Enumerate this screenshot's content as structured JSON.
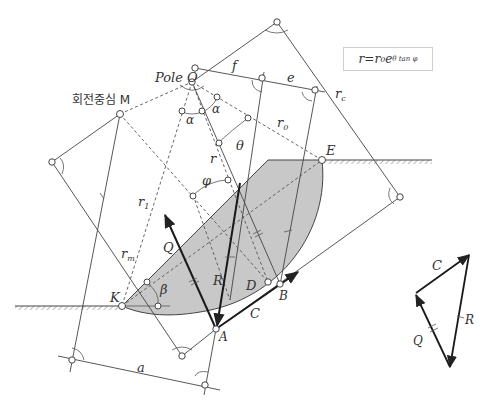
{
  "figure": {
    "formula": {
      "lhs": "r",
      "eq": " = ",
      "r0": "r",
      "r0_sub": "0",
      "base": "e",
      "exp": "θ tan φ"
    },
    "labels": {
      "pole": "Pole O",
      "rotation_center": "회전중심 M",
      "f": "f",
      "e": "e",
      "rc": "r",
      "rc_sub": "c",
      "r0": "r",
      "r0_sub": "0",
      "alpha1": "α",
      "alpha2": "α",
      "theta": "θ",
      "r": "r",
      "phi": "φ",
      "r1": "r",
      "r1_sub": "1",
      "rm": "r",
      "rm_sub": "m",
      "E": "E",
      "K": "K",
      "beta": "β",
      "Q": "Q",
      "R": "R",
      "D": "D",
      "B": "B",
      "A": "A",
      "C": "C",
      "a": "a"
    },
    "force_polygon": {
      "C": "C",
      "Q": "Q",
      "R": "R"
    },
    "colors": {
      "line": "#333333",
      "shade": "#c8c8c8",
      "thin": "#555555"
    }
  }
}
